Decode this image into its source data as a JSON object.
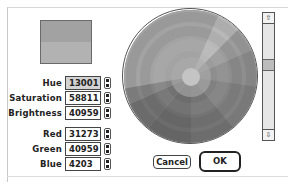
{
  "dialog": {
    "swatch": {
      "new_color": "#a2a2a2",
      "original_color": "#b2b2b2"
    },
    "fields": [
      {
        "label": "Hue",
        "value": "13001",
        "selected": true
      },
      {
        "label": "Saturation",
        "value": "58811",
        "selected": false
      },
      {
        "label": "Brightness",
        "value": "40959",
        "selected": false
      },
      {
        "label": "Red",
        "value": "31273",
        "selected": false
      },
      {
        "label": "Green",
        "value": "40959",
        "selected": false
      },
      {
        "label": "Blue",
        "value": "4203",
        "selected": false
      }
    ],
    "scrollbar": {
      "up_icon": "⇧",
      "down_icon": "⇩"
    },
    "buttons": {
      "cancel_label": "Cancel",
      "ok_label": "OK"
    }
  }
}
